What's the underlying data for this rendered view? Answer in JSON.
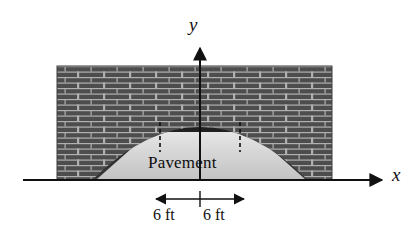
{
  "figure": {
    "axes": {
      "x_label": "x",
      "y_label": "y",
      "x_axis_name": "x-axis",
      "y_axis_name": "y-axis"
    },
    "annotations": {
      "pavement_label": "Pavement",
      "dimension_left": "6 ft",
      "dimension_right": "6 ft"
    },
    "colors": {
      "brick_dark": "#4a4a4a",
      "brick_mortar": "#b8b8b8",
      "arch_shadow": "#2b2b2b",
      "pavement_light": "#f2f2f2",
      "pavement_mid": "#cfcfcf",
      "axis": "#111111",
      "background": "#ffffff"
    },
    "geometry": {
      "wall_left": 57,
      "wall_right": 332,
      "wall_top": 66,
      "ground_y": 180,
      "origin_x": 200,
      "arch_apex_y": 93,
      "arch_half_width": 108,
      "tick_left_x": 160,
      "tick_right_x": 240,
      "dim_arrow_left_x": 156,
      "dim_arrow_right_x": 244,
      "y_axis_top": 48,
      "x_axis_left": 23,
      "x_axis_right": 382
    }
  }
}
